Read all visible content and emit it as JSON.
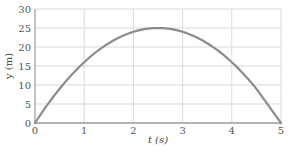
{
  "chart_data": {
    "type": "line",
    "title": "",
    "xlabel": "t (s)",
    "ylabel": "y (m)",
    "xlim": [
      0,
      5
    ],
    "ylim": [
      0,
      30
    ],
    "xticks": [
      0,
      1,
      2,
      3,
      4,
      5
    ],
    "yticks": [
      0,
      5,
      10,
      15,
      20,
      25,
      30
    ],
    "grid": true,
    "legend": null,
    "series": [
      {
        "name": "y(t)",
        "x": [
          0,
          0.5,
          1,
          1.5,
          2,
          2.5,
          3,
          3.5,
          4,
          4.5,
          5
        ],
        "values": [
          0,
          9,
          16,
          21,
          24,
          25,
          24,
          21,
          16,
          9,
          0
        ]
      }
    ]
  },
  "colors": {
    "curve": "#8c8c8c",
    "grid": "#d9d9d9",
    "axis": "#9a9a9a",
    "text": "#555555"
  }
}
